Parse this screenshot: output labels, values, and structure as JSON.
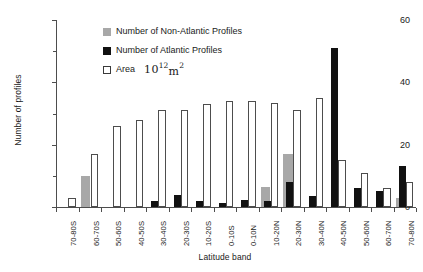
{
  "chart_data": {
    "type": "bar",
    "title": "",
    "xlabel": "Latitude band",
    "ylabel": "Number of profiles",
    "ylim": [
      0,
      60
    ],
    "yticks": [
      0,
      10,
      20,
      30,
      40,
      50,
      60
    ],
    "ytick_labels_major": [
      "0",
      "20",
      "40",
      "60"
    ],
    "grid": false,
    "legend_position": "top-left-inside",
    "annotation": "10¹² m²",
    "categories": [
      "70-80S",
      "60-70S",
      "50-60S",
      "40-50S",
      "30-40S",
      "20-30S",
      "10-20S",
      "0-10S",
      "0-10N",
      "10-20N",
      "20-30N",
      "30-40N",
      "40-50N",
      "50-60N",
      "60-70N",
      "70-80N"
    ],
    "series": [
      {
        "name": "Number of Non-Atlantic Profiles",
        "color": "#a8a8a8",
        "values": [
          0,
          10,
          0,
          0,
          0,
          0,
          0,
          0,
          0,
          6.5,
          17,
          0,
          0,
          0,
          0,
          3
        ]
      },
      {
        "name": "Number of Atlantic Profiles",
        "color": "#111111",
        "values": [
          0,
          0,
          0,
          0,
          1.8,
          3.8,
          1.8,
          1.2,
          2.4,
          1.8,
          8,
          3.5,
          51,
          6,
          5,
          13
        ]
      },
      {
        "name": "Area",
        "color": "#ffffff",
        "values": [
          3,
          17,
          26,
          28,
          31,
          31,
          33,
          34,
          34,
          33.5,
          31,
          35,
          15,
          11,
          6,
          8
        ]
      }
    ]
  },
  "legend": {
    "items": [
      {
        "label": "Number of Non-Atlantic Profiles",
        "swatch": "nonatl"
      },
      {
        "label": "Number of Atlantic Profiles",
        "swatch": "atl"
      },
      {
        "label": "Area",
        "swatch": "area"
      }
    ],
    "annotation_base": "10",
    "annotation_exp": "12",
    "annotation_unit": "m",
    "annotation_unit_exp": "2"
  },
  "axes": {
    "y_title": "Number of profiles",
    "x_title": "Latitude band",
    "y_labels": [
      {
        "value": 60,
        "text": "60",
        "major": true
      },
      {
        "value": 50,
        "text": "",
        "major": false
      },
      {
        "value": 40,
        "text": "40",
        "major": true
      },
      {
        "value": 30,
        "text": "",
        "major": false
      },
      {
        "value": 20,
        "text": "20",
        "major": true
      },
      {
        "value": 10,
        "text": "",
        "major": false
      },
      {
        "value": 0,
        "text": "0",
        "major": true
      }
    ]
  }
}
